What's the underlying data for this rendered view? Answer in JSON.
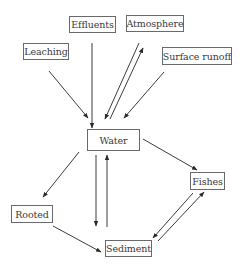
{
  "diagram": {
    "nodes": [
      {
        "id": "leaching",
        "label": "Leaching"
      },
      {
        "id": "effluents",
        "label": "Effluents"
      },
      {
        "id": "atmosphere",
        "label": "Atmosphere"
      },
      {
        "id": "surface-runoff",
        "label": "Surface runoff"
      },
      {
        "id": "water",
        "label": "Water"
      },
      {
        "id": "fishes",
        "label": "Fishes"
      },
      {
        "id": "rooted",
        "label": "Rooted"
      },
      {
        "id": "sediment",
        "label": "Sediment"
      }
    ],
    "edges": [
      {
        "from": "leaching",
        "to": "water"
      },
      {
        "from": "effluents",
        "to": "water"
      },
      {
        "from": "atmosphere",
        "to": "water"
      },
      {
        "from": "water",
        "to": "atmosphere"
      },
      {
        "from": "surface-runoff",
        "to": "water"
      },
      {
        "from": "water",
        "to": "fishes"
      },
      {
        "from": "water",
        "to": "rooted"
      },
      {
        "from": "water",
        "to": "sediment"
      },
      {
        "from": "sediment",
        "to": "water"
      },
      {
        "from": "rooted",
        "to": "sediment"
      },
      {
        "from": "fishes",
        "to": "sediment"
      },
      {
        "from": "sediment",
        "to": "fishes"
      }
    ]
  }
}
